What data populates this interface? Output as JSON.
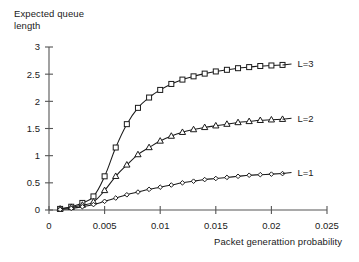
{
  "chart_data": {
    "type": "line",
    "title": "",
    "xlabel": "Packet generattion probability",
    "ylabel": "Expected queue\nlength",
    "xlim": [
      0,
      0.025
    ],
    "ylim": [
      0,
      3
    ],
    "grid": false,
    "legend_position": "right-inline",
    "xticks": [
      "0",
      "0.005",
      "0.01",
      "0.015",
      "0.02",
      "0.025"
    ],
    "xtick_values": [
      0,
      0.005,
      0.01,
      0.015,
      0.02,
      0.025
    ],
    "yticks": [
      "0",
      "0.5",
      "1",
      "1.5",
      "2",
      "2.5",
      "3"
    ],
    "ytick_values": [
      0,
      0.5,
      1,
      1.5,
      2,
      2.5,
      3
    ],
    "x": [
      0.001,
      0.002,
      0.003,
      0.004,
      0.005,
      0.006,
      0.007,
      0.008,
      0.009,
      0.01,
      0.011,
      0.012,
      0.013,
      0.014,
      0.015,
      0.016,
      0.017,
      0.018,
      0.019,
      0.02,
      0.021
    ],
    "series": [
      {
        "name": "L=3",
        "label": "L=3",
        "marker": "square",
        "values": [
          0.02,
          0.06,
          0.13,
          0.25,
          0.62,
          1.15,
          1.58,
          1.88,
          2.07,
          2.21,
          2.32,
          2.4,
          2.46,
          2.51,
          2.55,
          2.58,
          2.61,
          2.63,
          2.65,
          2.66,
          2.67
        ]
      },
      {
        "name": "L=2",
        "label": "L=2",
        "marker": "triangle",
        "values": [
          0.02,
          0.05,
          0.09,
          0.15,
          0.36,
          0.62,
          0.83,
          1.02,
          1.15,
          1.27,
          1.36,
          1.43,
          1.48,
          1.52,
          1.55,
          1.58,
          1.61,
          1.63,
          1.65,
          1.66,
          1.67
        ]
      },
      {
        "name": "L=1",
        "label": "L=1",
        "marker": "diamond",
        "values": [
          0.01,
          0.03,
          0.06,
          0.1,
          0.16,
          0.22,
          0.28,
          0.33,
          0.38,
          0.42,
          0.46,
          0.5,
          0.53,
          0.56,
          0.58,
          0.6,
          0.62,
          0.64,
          0.65,
          0.66,
          0.67
        ]
      }
    ],
    "colors": {
      "line": "#1a1a1a",
      "marker_fill": "#ffffff",
      "axis": "#555555",
      "text": "#1a1a1a",
      "background": "#ffffff"
    }
  }
}
